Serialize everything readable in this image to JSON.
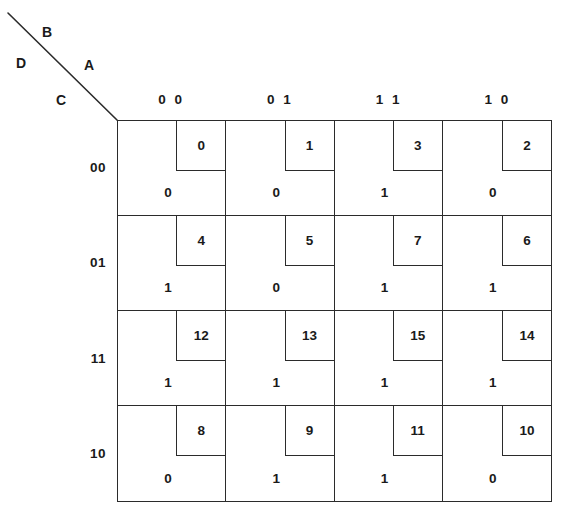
{
  "corner": {
    "diagonal_icon": "diagonal-divider-line",
    "vars": {
      "b": "B",
      "d": "D",
      "a": "A",
      "c": "C"
    }
  },
  "axes": {
    "column_headers": [
      "0 0",
      "0 1",
      "1 1",
      "1 0"
    ],
    "row_headers": [
      "00",
      "01",
      "11",
      "10"
    ]
  },
  "colors": {
    "line": "#2b2b2b",
    "text": "#1a1a1a",
    "background": "#ffffff"
  },
  "chart_data": {
    "type": "table",
    "title": "",
    "map_kind": "karnaugh-map",
    "variables": [
      "A",
      "B",
      "C",
      "D"
    ],
    "column_variables": "AB",
    "row_variables": "CD",
    "columns": [
      "0 0",
      "0 1",
      "1 1",
      "1 0"
    ],
    "rows": [
      "00",
      "01",
      "11",
      "10"
    ],
    "cells": [
      [
        {
          "index": "0",
          "value": "0"
        },
        {
          "index": "1",
          "value": "0"
        },
        {
          "index": "3",
          "value": "1"
        },
        {
          "index": "2",
          "value": "0"
        }
      ],
      [
        {
          "index": "4",
          "value": "1"
        },
        {
          "index": "5",
          "value": "0"
        },
        {
          "index": "7",
          "value": "1"
        },
        {
          "index": "6",
          "value": "1"
        }
      ],
      [
        {
          "index": "12",
          "value": "1"
        },
        {
          "index": "13",
          "value": "1"
        },
        {
          "index": "15",
          "value": "1"
        },
        {
          "index": "14",
          "value": "1"
        }
      ],
      [
        {
          "index": "8",
          "value": "0"
        },
        {
          "index": "9",
          "value": "1"
        },
        {
          "index": "11",
          "value": "1"
        },
        {
          "index": "10",
          "value": "0"
        }
      ]
    ]
  }
}
